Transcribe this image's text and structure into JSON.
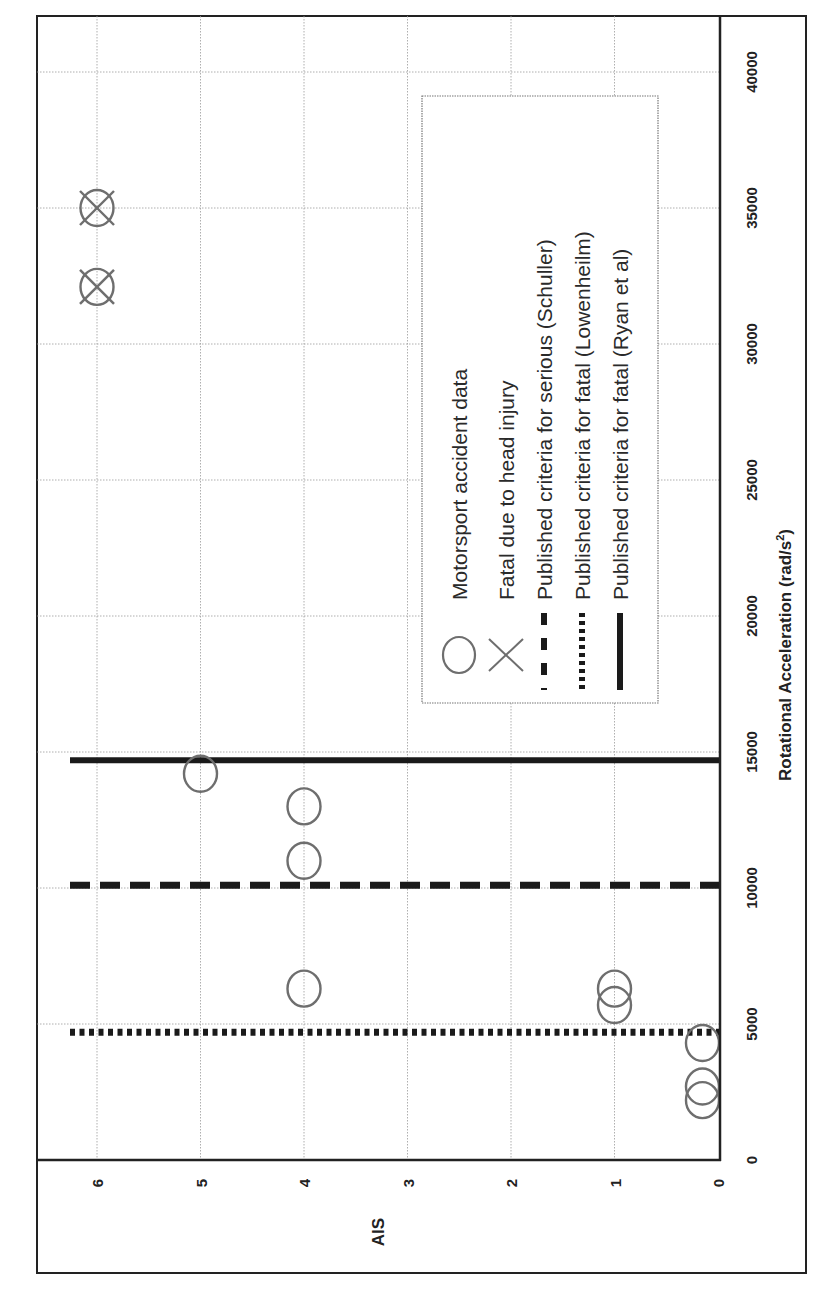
{
  "chart_data": {
    "type": "scatter",
    "orientation": "rotated 90° counter-clockwise (x-axis runs bottom-to-top along right side, AIS runs right-to-left along bottom)",
    "title": "",
    "xlabel": "Rotational Acceleration (rad/s²)",
    "xlabel_main": "Rotational Acceleration (rad/s",
    "xlabel_sup": "2",
    "xlabel_end": ")",
    "ylabel": "AIS",
    "xlim": [
      0,
      42000
    ],
    "ylim": [
      0,
      6.55
    ],
    "x_ticks": [
      0,
      5000,
      10000,
      15000,
      20000,
      25000,
      30000,
      35000,
      40000
    ],
    "x_tick_labels": [
      "0",
      "5000",
      "10000",
      "15000",
      "20000",
      "25000",
      "30000",
      "35000",
      "40000"
    ],
    "y_ticks": [
      0,
      1,
      2,
      3,
      4,
      5,
      6
    ],
    "y_tick_labels": [
      "0",
      "1",
      "2",
      "3",
      "4",
      "5",
      "6"
    ],
    "grid": true,
    "legend_position": "inside, upper-middle (rotated)",
    "series": [
      {
        "name": "Motorsport accident data",
        "marker": "circle",
        "points": [
          {
            "x": 2200,
            "y": 0.15
          },
          {
            "x": 2700,
            "y": 0.15
          },
          {
            "x": 4300,
            "y": 0.15
          },
          {
            "x": 5700,
            "y": 1
          },
          {
            "x": 6300,
            "y": 1
          },
          {
            "x": 6300,
            "y": 4
          },
          {
            "x": 11000,
            "y": 4
          },
          {
            "x": 13000,
            "y": 4
          },
          {
            "x": 14200,
            "y": 5
          }
        ]
      },
      {
        "name": "Fatal due to head injury",
        "marker": "circle-x",
        "points": [
          {
            "x": 32100,
            "y": 6
          },
          {
            "x": 35000,
            "y": 6
          }
        ]
      }
    ],
    "reference_lines": [
      {
        "name": "Published criteria for serious (Schuller)",
        "style": "dashed",
        "x": 10100
      },
      {
        "name": "Published criteria for fatal (Lowenheilm)",
        "style": "dotted",
        "x": 4700
      },
      {
        "name": "Published criteria for fatal (Ryan et al)",
        "style": "solid",
        "x": 14700
      }
    ],
    "legend": [
      {
        "symbol": "circle",
        "label": "Motorsport accident data"
      },
      {
        "symbol": "x",
        "label": "Fatal due to head injury"
      },
      {
        "symbol": "dashed",
        "label": "Published criteria for serious (Schuller)"
      },
      {
        "symbol": "dotted",
        "label": "Published criteria for fatal (Lowenheilm)"
      },
      {
        "symbol": "solid",
        "label": "Published criteria for fatal (Ryan et al)"
      }
    ],
    "colors": {
      "frame": "#222222",
      "grid": "#9a9a9a",
      "marker": "#6e6e6e",
      "lines": "#1a1a1a"
    }
  }
}
